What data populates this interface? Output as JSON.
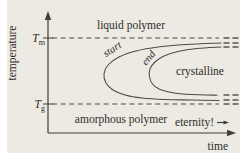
{
  "labels": {
    "y_axis": "temperature",
    "x_axis": "time",
    "tm_main": "T",
    "tm_sub": "m",
    "tg_main": "T",
    "tg_sub": "g",
    "liquid": "liquid polymer",
    "crystalline": "crystalline",
    "amorphous": "amorphous polymer",
    "start": "start",
    "end": "end",
    "eternity": "eternity!"
  },
  "colors": {
    "panel_background": "#eceae2",
    "page_background": "#ffffff",
    "line": "#4b4b47",
    "text": "#2e2d29"
  },
  "chart_data": {
    "type": "line",
    "xlabel": "time",
    "ylabel": "temperature",
    "axes_note": "schematic, no numeric scale; x and y axes drawn with arrowheads",
    "legend": "none",
    "grid": false,
    "reference_lines": [
      {
        "name": "Tm",
        "label": "T_m (melting temperature)",
        "y": 38,
        "x1": 52,
        "x2": 219,
        "style": "dashed",
        "tick": [
          43,
          53
        ]
      },
      {
        "name": "Tg",
        "label": "T_g (glass transition temperature)",
        "y": 104,
        "x1": 52,
        "x2": 219,
        "style": "dashed",
        "tick": [
          43,
          53
        ]
      }
    ],
    "series": [
      {
        "name": "start",
        "points": [
          [
            221,
            43
          ],
          [
            186,
            44.5
          ],
          [
            158,
            47
          ],
          [
            136,
            51
          ],
          [
            119,
            57
          ],
          [
            108,
            65
          ],
          [
            104,
            74
          ],
          [
            106,
            83
          ],
          [
            113,
            90
          ],
          [
            125,
            95
          ],
          [
            142,
            98
          ],
          [
            165,
            99.5
          ],
          [
            192,
            100
          ],
          [
            219,
            100.5
          ]
        ]
      },
      {
        "name": "end",
        "points": [
          [
            221,
            47
          ],
          [
            197,
            48.5
          ],
          [
            178,
            51.5
          ],
          [
            164,
            56
          ],
          [
            155,
            62
          ],
          [
            150,
            69
          ],
          [
            149.5,
            77
          ],
          [
            152.5,
            84
          ],
          [
            159,
            89
          ],
          [
            169,
            92
          ],
          [
            183,
            94
          ],
          [
            200,
            94.8
          ],
          [
            217,
            95.2
          ]
        ]
      }
    ],
    "continuation_marks": {
      "rows_y": [
        38,
        43,
        47,
        95,
        100,
        104
      ],
      "dash_x": [
        [
          223.5,
          229.5
        ],
        [
          232.5,
          238.5
        ]
      ]
    },
    "annotations": [
      {
        "text": "liquid polymer",
        "region": "above Tm"
      },
      {
        "text": "crystalline",
        "region": "inside end curve, right"
      },
      {
        "text": "amorphous polymer",
        "region": "below Tg"
      },
      {
        "text": "start",
        "rotation_deg": -33,
        "on": "outer C-curve"
      },
      {
        "text": "end",
        "rotation_deg": -48,
        "on": "inner C-curve"
      },
      {
        "text": "eternity!",
        "region": "bottom right, with right arrow"
      }
    ]
  }
}
